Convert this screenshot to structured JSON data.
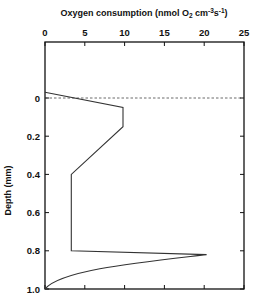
{
  "chart_data": {
    "type": "line",
    "title": "",
    "xlabel": "Oxygen consumption (nmol O2 cm-3 s-1)",
    "xlabel_parts": {
      "main": "Oxygen consumption  (nmol O",
      "sub": "2",
      "mid": " cm",
      "sup1": "-3",
      "s": "s",
      "sup2": "-1",
      "end": ")"
    },
    "ylabel": "Depth (mm)",
    "xlim": [
      0,
      25
    ],
    "ylim": [
      1.0,
      -0.18
    ],
    "x_ticks": [
      0,
      5,
      10,
      15,
      20,
      25
    ],
    "x_tick_labels": [
      "0",
      "5",
      "10",
      "15",
      "20",
      "25"
    ],
    "y_ticks": [
      0,
      0.2,
      0.4,
      0.6,
      0.8,
      1.0
    ],
    "y_tick_labels": [
      "0",
      "0.2",
      "0.4",
      "0.6",
      "0.8",
      "1.0"
    ],
    "x_axis_position": "top",
    "grid": false,
    "reference_line": {
      "depth": 0,
      "style": "dashed"
    },
    "series": [
      {
        "name": "Oxygen consumption profile",
        "points": [
          {
            "x": 0.0,
            "depth": -0.03
          },
          {
            "x": 9.8,
            "depth": 0.05
          },
          {
            "x": 9.8,
            "depth": 0.15
          },
          {
            "x": 3.3,
            "depth": 0.4
          },
          {
            "x": 3.3,
            "depth": 0.8
          },
          {
            "x": 20.3,
            "depth": 0.82
          },
          {
            "x": 10.0,
            "depth": 0.87
          },
          {
            "x": 5.0,
            "depth": 0.91
          },
          {
            "x": 2.5,
            "depth": 0.94
          },
          {
            "x": 1.0,
            "depth": 0.97
          },
          {
            "x": 0.0,
            "depth": 1.0
          }
        ]
      }
    ]
  },
  "colors": {
    "line": "#333333",
    "axis": "#111111",
    "background": "#ffffff"
  }
}
